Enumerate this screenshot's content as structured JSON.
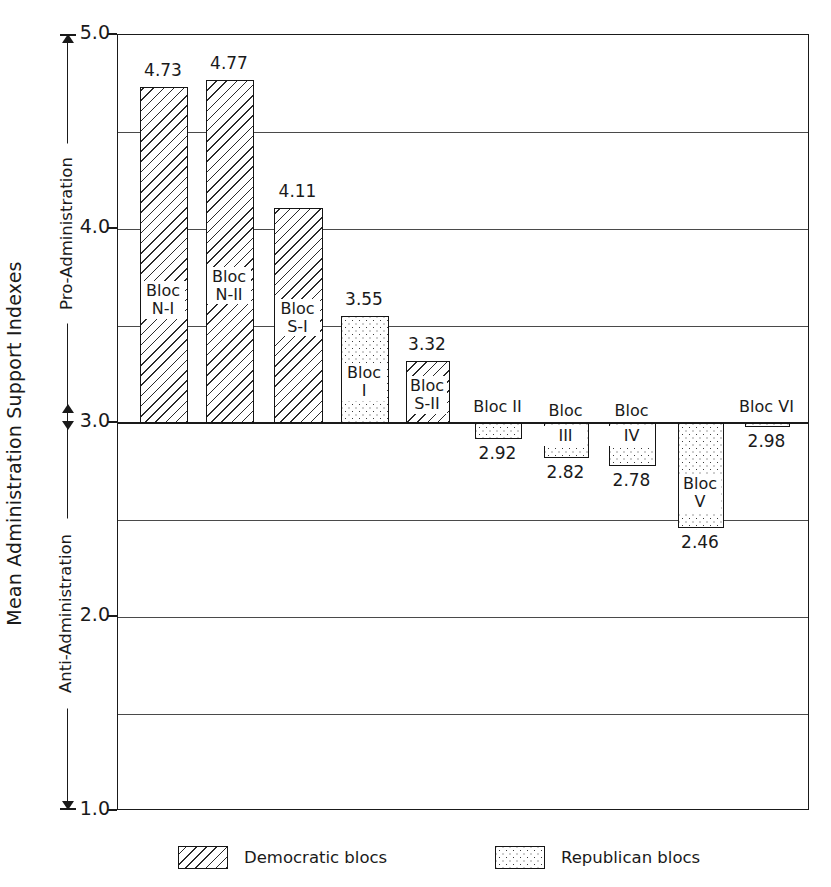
{
  "chart_data": {
    "type": "bar",
    "title": "",
    "ylabel": "Mean Administration Support Indexes",
    "xlabel": "",
    "ylim": [
      1.0,
      5.0
    ],
    "grid": true,
    "gridlines": [
      5.0,
      4.5,
      4.0,
      3.5,
      3.0,
      2.5,
      2.0,
      1.5,
      1.0
    ],
    "ytick_labels": [
      "5.0",
      "4.0",
      "3.0",
      "2.0",
      "1.0"
    ],
    "ytick_values": [
      5.0,
      4.0,
      3.0,
      2.0,
      1.0
    ],
    "baseline": 3.0,
    "direction_labels": {
      "upper": "Pro-Administration",
      "lower": "Anti-Administration"
    },
    "legend": {
      "position": "bottom",
      "entries": [
        {
          "label": "Democratic blocs",
          "pattern": "hatch"
        },
        {
          "label": "Republican blocs",
          "pattern": "dots"
        }
      ]
    },
    "categories": [
      "Bloc\nN-I",
      "Bloc\nN-II",
      "Bloc\nS-I",
      "Bloc\nI",
      "Bloc\nS-II",
      "Bloc II",
      "Bloc\nIII",
      "Bloc\nIV",
      "Bloc\nV",
      "Bloc VI"
    ],
    "values": [
      4.73,
      4.77,
      4.11,
      3.55,
      3.32,
      2.92,
      2.82,
      2.78,
      2.46,
      2.98
    ],
    "value_labels": [
      "4.73",
      "4.77",
      "4.11",
      "3.55",
      "3.32",
      "2.92",
      "2.82",
      "2.78",
      "2.46",
      "2.98"
    ],
    "series": [
      {
        "name": "Democratic blocs",
        "pattern": "hatch",
        "members": [
          "Bloc N-I",
          "Bloc N-II",
          "Bloc S-I",
          "Bloc S-II"
        ]
      },
      {
        "name": "Republican blocs",
        "pattern": "dots",
        "members": [
          "Bloc I",
          "Bloc II",
          "Bloc III",
          "Bloc IV",
          "Bloc V",
          "Bloc VI"
        ]
      }
    ],
    "bars": [
      {
        "name": "Bloc N-I",
        "label": "Bloc\nN-I",
        "value": 4.73,
        "value_label": "4.73",
        "pattern": "hatch",
        "party": "Democratic blocs",
        "x": 139,
        "w": 48,
        "label_pos": "inside",
        "label_offset": 195,
        "value_pos": "above"
      },
      {
        "name": "Bloc N-II",
        "label": "Bloc\nN-II",
        "value": 4.77,
        "value_label": "4.77",
        "pattern": "hatch",
        "party": "Democratic blocs",
        "x": 205,
        "w": 48,
        "label_pos": "inside",
        "label_offset": 188,
        "value_pos": "above"
      },
      {
        "name": "Bloc S-I",
        "label": "Bloc\nS-I",
        "value": 4.11,
        "value_label": "4.11",
        "pattern": "hatch",
        "party": "Democratic blocs",
        "x": 273,
        "w": 49,
        "label_pos": "inside",
        "label_offset": 92,
        "value_pos": "above"
      },
      {
        "name": "Bloc I",
        "label": "Bloc\nI",
        "value": 3.55,
        "value_label": "3.55",
        "pattern": "dots",
        "party": "Republican blocs",
        "x": 340,
        "w": 48,
        "label_pos": "inside",
        "label_offset": 48,
        "value_pos": "above"
      },
      {
        "name": "Bloc S-II",
        "label": "Bloc\nS-II",
        "value": 3.32,
        "value_label": "3.32",
        "pattern": "hatch",
        "party": "Democratic blocs",
        "x": 405,
        "w": 44,
        "label_pos": "inside",
        "label_offset": 16,
        "value_pos": "above"
      },
      {
        "name": "Bloc II",
        "label": "Bloc II",
        "value": 2.92,
        "value_label": "2.92",
        "pattern": "dots",
        "party": "Republican blocs",
        "x": 474,
        "w": 47,
        "label_pos": "above",
        "label_offset": 0,
        "value_pos": "below"
      },
      {
        "name": "Bloc III",
        "label": "Bloc\nIII",
        "value": 2.82,
        "value_label": "2.82",
        "pattern": "dots",
        "party": "Republican blocs",
        "x": 543,
        "w": 45,
        "label_pos": "split",
        "label_offset": 6,
        "value_pos": "below"
      },
      {
        "name": "Bloc IV",
        "label": "Bloc\nIV",
        "value": 2.78,
        "value_label": "2.78",
        "pattern": "dots",
        "party": "Republican blocs",
        "x": 608,
        "w": 47,
        "label_pos": "split",
        "label_offset": 6,
        "value_pos": "below"
      },
      {
        "name": "Bloc V",
        "label": "Bloc\nV",
        "value": 2.46,
        "value_label": "2.46",
        "pattern": "dots",
        "party": "Republican blocs",
        "x": 677,
        "w": 46,
        "label_pos": "inside",
        "label_offset": 52,
        "value_pos": "below"
      },
      {
        "name": "Bloc VI",
        "label": "Bloc VI",
        "value": 2.98,
        "value_label": "2.98",
        "pattern": "dots",
        "party": "Republican blocs",
        "x": 744,
        "w": 45,
        "label_pos": "above",
        "label_offset": 0,
        "value_pos": "below"
      }
    ]
  }
}
